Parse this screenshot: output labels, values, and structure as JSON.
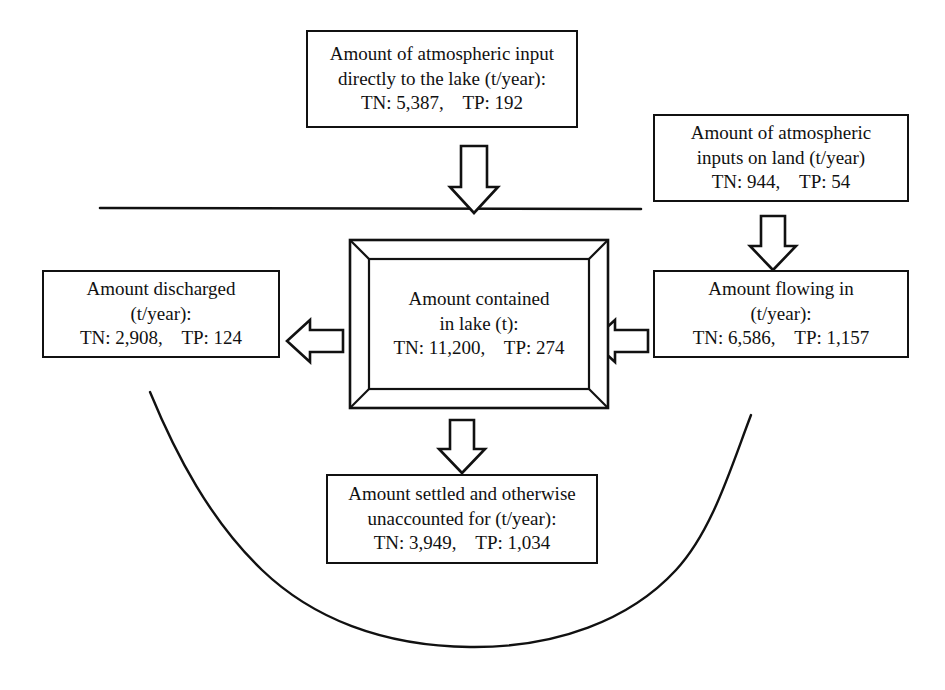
{
  "diagram": {
    "stroke_color": "#111111",
    "background_color": "#ffffff",
    "boxes": {
      "atmospheric_to_lake": {
        "name": "Amount of atmospheric input directly to the lake",
        "line1": "Amount of atmospheric input",
        "line2": "directly to the lake (t/year):",
        "line3": "TN: 5,387,    TP: 192",
        "TN": "5,387",
        "TP": "192",
        "units": "t/year"
      },
      "atmospheric_on_land": {
        "name": "Amount of atmospheric inputs on land",
        "line1": "Amount of atmospheric",
        "line2": "inputs on land (t/year)",
        "line3": "TN: 944,    TP: 54",
        "TN": "944",
        "TP": "54",
        "units": "t/year"
      },
      "contained_in_lake": {
        "name": "Amount contained in lake",
        "line1": "Amount contained",
        "line2": "in lake (t):",
        "line3": "TN: 11,200,    TP: 274",
        "TN": "11,200",
        "TP": "274",
        "units": "t"
      },
      "discharged": {
        "name": "Amount discharged",
        "line1": "Amount discharged",
        "line2": "(t/year):",
        "line3": "TN: 2,908,    TP: 124",
        "TN": "2,908",
        "TP": "124",
        "units": "t/year"
      },
      "flowing_in": {
        "name": "Amount flowing in",
        "line1": "Amount flowing in",
        "line2": "(t/year):",
        "line3": "TN: 6,586,    TP: 1,157",
        "TN": "6,586",
        "TP": "1,157",
        "units": "t/year"
      },
      "settled_unaccounted": {
        "name": "Amount settled and otherwise unaccounted for",
        "line1": "Amount settled and otherwise",
        "line2": "unaccounted for (t/year):",
        "line3": "TN: 3,949,    TP: 1,034",
        "TN": "3,949",
        "TP": "1,034",
        "units": "t/year"
      }
    },
    "arrows": [
      {
        "id": "arrow-atmos-to-lake",
        "icon": "arrow-down-icon",
        "direction": "down",
        "from": "atmospheric_to_lake",
        "to": "contained_in_lake"
      },
      {
        "id": "arrow-land-to-inflow",
        "icon": "arrow-down-icon",
        "direction": "down",
        "from": "atmospheric_on_land",
        "to": "flowing_in"
      },
      {
        "id": "arrow-inflow-to-lake",
        "icon": "arrow-left-icon",
        "direction": "left",
        "from": "flowing_in",
        "to": "contained_in_lake"
      },
      {
        "id": "arrow-lake-to-discharge",
        "icon": "arrow-left-icon",
        "direction": "left",
        "from": "contained_in_lake",
        "to": "discharged"
      },
      {
        "id": "arrow-lake-to-settled",
        "icon": "arrow-down-icon",
        "direction": "down",
        "from": "contained_in_lake",
        "to": "settled_unaccounted"
      }
    ],
    "decorations": {
      "water_surface_line": "horizontal line representing the lake water surface",
      "lake_basin_curve": "U-shaped curve representing the lake basin cross-section"
    }
  }
}
